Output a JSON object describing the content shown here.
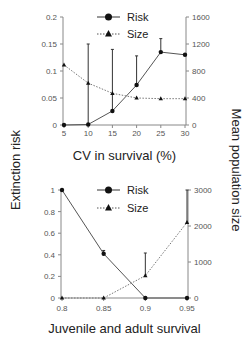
{
  "y_left_label": "Extinction risk",
  "y_right_label": "Mean population size",
  "chart_data": [
    {
      "type": "line",
      "xlabel": "CV in survival (%)",
      "ylabel": "Extinction risk",
      "y2label": "Mean population size",
      "x": [
        5,
        10,
        15,
        20,
        25,
        30
      ],
      "x_ticks": [
        "5",
        "10",
        "15",
        "20",
        "25",
        "30"
      ],
      "xlim": [
        5,
        30
      ],
      "ylim": [
        0,
        0.2
      ],
      "y_ticks": [
        "0",
        "0.05",
        "0.1",
        "0.15",
        "0.2"
      ],
      "y_tick_values": [
        0,
        0.05,
        0.1,
        0.15,
        0.2
      ],
      "y2lim": [
        0,
        1600
      ],
      "y2_ticks": [
        "0",
        "400",
        "800",
        "1200",
        "1600"
      ],
      "y2_tick_values": [
        0,
        400,
        800,
        1200,
        1600
      ],
      "legend": "top-center",
      "series": [
        {
          "name": "Risk",
          "axis": "left",
          "marker": "circle",
          "style": "solid",
          "values": [
            0,
            0.001,
            0.026,
            0.074,
            0.135,
            0.13
          ],
          "err_high": [
            0,
            0.15,
            0.14,
            0.128,
            0.16,
            0.13
          ]
        },
        {
          "name": "Size",
          "axis": "right",
          "marker": "triangle",
          "style": "dotted",
          "values": [
            890,
            620,
            470,
            400,
            390,
            390
          ],
          "err_high": [
            890,
            620,
            470,
            400,
            390,
            390
          ]
        }
      ]
    },
    {
      "type": "line",
      "xlabel": "Juvenile and adult survival",
      "ylabel": "Extinction risk",
      "y2label": "Mean population size",
      "x": [
        0.8,
        0.85,
        0.9,
        0.95
      ],
      "x_ticks": [
        "0.8",
        "0.85",
        "0.9",
        "0.95"
      ],
      "xlim": [
        0.8,
        0.95
      ],
      "ylim": [
        0,
        1
      ],
      "y_ticks": [
        "0",
        "0.2",
        "0.4",
        "0.6",
        "0.8",
        "1"
      ],
      "y_tick_values": [
        0,
        0.2,
        0.4,
        0.6,
        0.8,
        1
      ],
      "y2lim": [
        0,
        3000
      ],
      "y2_ticks": [
        "0",
        "1000",
        "2000",
        "3000"
      ],
      "y2_tick_values": [
        0,
        1000,
        2000,
        3000
      ],
      "legend": "top-center",
      "series": [
        {
          "name": "Risk",
          "axis": "left",
          "marker": "circle",
          "style": "solid",
          "values": [
            1,
            0.41,
            0,
            0
          ],
          "err_high": [
            1,
            0.44,
            0,
            0
          ]
        },
        {
          "name": "Size",
          "axis": "right",
          "marker": "triangle",
          "style": "dotted",
          "values": [
            0,
            0,
            620,
            2100
          ],
          "err_high": [
            0,
            0,
            1250,
            3000
          ]
        }
      ]
    }
  ]
}
